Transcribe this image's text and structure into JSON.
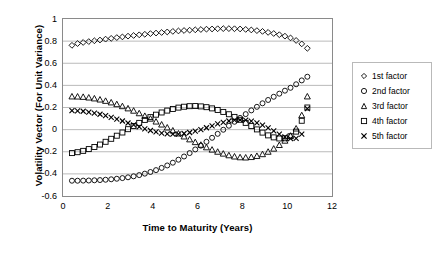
{
  "chart_data": {
    "type": "scatter",
    "title": "",
    "xlabel": "Time to Maturity (Years)",
    "ylabel": "Volatility Vector (For Unit Variance)",
    "xlim": [
      0,
      12
    ],
    "ylim": [
      -0.6,
      1
    ],
    "xticks": [
      0,
      2,
      4,
      6,
      8,
      10,
      12
    ],
    "yticks": [
      -0.6,
      -0.4,
      -0.2,
      0,
      0.2,
      0.4,
      0.6,
      0.8,
      1
    ],
    "xticklabels": [
      "0",
      "2",
      "4",
      "6",
      "8",
      "10",
      "12"
    ],
    "yticklabels": [
      "-0.6",
      "-0.4",
      "-0.2",
      "0",
      "0.2",
      "0.4",
      "0.6",
      "0.8",
      "1"
    ],
    "grid": "horizontal",
    "legend_position": "right",
    "x": [
      0.4,
      0.65,
      0.9,
      1.15,
      1.4,
      1.65,
      1.9,
      2.15,
      2.4,
      2.65,
      2.9,
      3.15,
      3.4,
      3.65,
      3.9,
      4.15,
      4.4,
      4.65,
      4.9,
      5.15,
      5.4,
      5.65,
      5.9,
      6.15,
      6.4,
      6.65,
      6.9,
      7.15,
      7.4,
      7.65,
      7.9,
      8.15,
      8.4,
      8.65,
      8.9,
      9.15,
      9.4,
      9.65,
      9.9,
      10.15,
      10.4,
      10.65,
      10.9
    ],
    "series": [
      {
        "name": "1st factor",
        "marker": "diamond",
        "values": [
          0.762,
          0.778,
          0.788,
          0.796,
          0.803,
          0.81,
          0.818,
          0.825,
          0.832,
          0.838,
          0.845,
          0.851,
          0.857,
          0.862,
          0.868,
          0.873,
          0.878,
          0.883,
          0.888,
          0.892,
          0.896,
          0.899,
          0.902,
          0.905,
          0.908,
          0.91,
          0.912,
          0.913,
          0.913,
          0.912,
          0.91,
          0.906,
          0.901,
          0.895,
          0.888,
          0.879,
          0.869,
          0.858,
          0.845,
          0.829,
          0.806,
          0.775,
          0.735
        ]
      },
      {
        "name": "2nd factor",
        "marker": "circle",
        "values": [
          -0.462,
          -0.462,
          -0.461,
          -0.46,
          -0.458,
          -0.456,
          -0.453,
          -0.449,
          -0.444,
          -0.438,
          -0.431,
          -0.422,
          -0.411,
          -0.398,
          -0.383,
          -0.366,
          -0.346,
          -0.324,
          -0.299,
          -0.272,
          -0.243,
          -0.212,
          -0.179,
          -0.145,
          -0.11,
          -0.074,
          -0.038,
          -0.001,
          0.035,
          0.071,
          0.106,
          0.14,
          0.174,
          0.206,
          0.238,
          0.268,
          0.297,
          0.325,
          0.352,
          0.378,
          0.41,
          0.445,
          0.478
        ]
      },
      {
        "name": "3rd factor",
        "marker": "triangle",
        "values": [
          0.3,
          0.299,
          0.296,
          0.29,
          0.282,
          0.272,
          0.26,
          0.246,
          0.23,
          0.212,
          0.192,
          0.171,
          0.148,
          0.124,
          0.099,
          0.073,
          0.046,
          0.019,
          -0.008,
          -0.035,
          -0.062,
          -0.088,
          -0.113,
          -0.137,
          -0.16,
          -0.181,
          -0.2,
          -0.217,
          -0.232,
          -0.243,
          -0.25,
          -0.252,
          -0.248,
          -0.238,
          -0.222,
          -0.2,
          -0.172,
          -0.139,
          -0.1,
          -0.055,
          0.01,
          0.13,
          0.3
        ]
      },
      {
        "name": "4th factor",
        "marker": "square",
        "values": [
          -0.212,
          -0.204,
          -0.192,
          -0.176,
          -0.157,
          -0.135,
          -0.11,
          -0.083,
          -0.055,
          -0.026,
          0.004,
          0.033,
          0.061,
          0.088,
          0.113,
          0.135,
          0.155,
          0.172,
          0.187,
          0.199,
          0.207,
          0.212,
          0.213,
          0.21,
          0.203,
          0.192,
          0.178,
          0.16,
          0.139,
          0.115,
          0.089,
          0.061,
          0.032,
          0.002,
          -0.027,
          -0.052,
          -0.07,
          -0.08,
          -0.078,
          -0.06,
          -0.018,
          0.08,
          0.2
        ]
      },
      {
        "name": "5th factor",
        "marker": "x",
        "values": [
          0.172,
          0.17,
          0.166,
          0.159,
          0.15,
          0.139,
          0.126,
          0.111,
          0.095,
          0.078,
          0.06,
          0.042,
          0.024,
          0.007,
          -0.008,
          -0.021,
          -0.031,
          -0.038,
          -0.041,
          -0.04,
          -0.035,
          -0.026,
          -0.014,
          0.001,
          0.017,
          0.034,
          0.051,
          0.066,
          0.078,
          0.086,
          0.089,
          0.086,
          0.077,
          0.062,
          0.041,
          0.016,
          -0.012,
          -0.04,
          -0.065,
          -0.082,
          -0.08,
          -0.04,
          0.19
        ]
      }
    ]
  },
  "legend": {
    "items": [
      {
        "label": "1st factor",
        "marker": "diamond-marker-icon"
      },
      {
        "label": "2nd factor",
        "marker": "circle-marker-icon"
      },
      {
        "label": "3rd factor",
        "marker": "triangle-marker-icon"
      },
      {
        "label": "4th factor",
        "marker": "square-marker-icon"
      },
      {
        "label": "5th factor",
        "marker": "x-marker-icon"
      }
    ]
  },
  "colors": {
    "frame": "#8a8a8a",
    "grid": "#a8a8a8",
    "marker": "#000000",
    "background": "#ffffff"
  }
}
